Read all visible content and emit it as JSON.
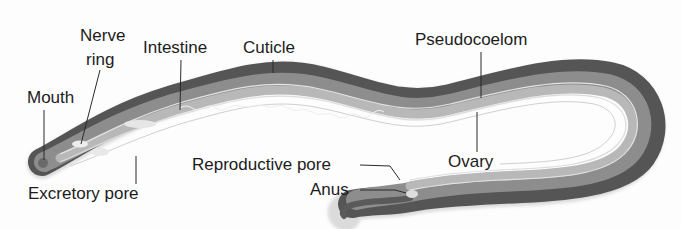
{
  "figure": {
    "colors": {
      "background": "#fdfdfd",
      "cuticle_dark": "#5a5a5a",
      "body_mid": "#8e8e8e",
      "body_light": "#c4c4c4",
      "inner_line": "#e6e6e6",
      "label_text": "#1c1c1c",
      "leader_line": "#2a2a2a"
    }
  },
  "labels": {
    "nerve_ring_line1": "Nerve",
    "nerve_ring_line2": "ring",
    "mouth": "Mouth",
    "intestine": "Intestine",
    "cuticle": "Cuticle",
    "pseudocoelom": "Pseudocoelom",
    "ovary": "Ovary",
    "reproductive_pore": "Reproductive pore",
    "anus": "Anus",
    "excretory_pore": "Excretory pore"
  }
}
